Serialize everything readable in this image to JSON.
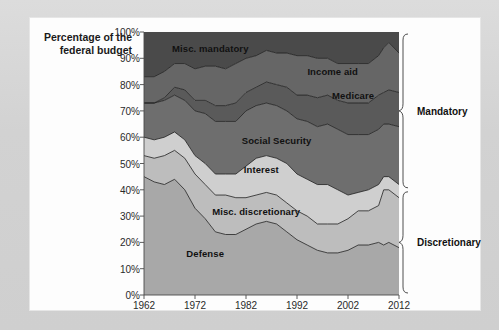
{
  "figure": {
    "background_color": "#d4d4d4",
    "card_color": "#fdfdfd"
  },
  "chart_data": {
    "type": "area",
    "title": "",
    "subtitle": "",
    "xlabel": "",
    "ylabel": "Percentage of the federal budget",
    "ylabel_line1": "Percentage of the",
    "ylabel_line2": "federal budget",
    "stacked": true,
    "normalized": true,
    "grid": false,
    "legend_position": "inline-labels",
    "xlim": [
      1962,
      2012
    ],
    "ylim": [
      0,
      100
    ],
    "xticks": [
      1962,
      1972,
      1982,
      1992,
      2002,
      2012
    ],
    "xtick_labels": [
      "1962",
      "1972",
      "1982",
      "1992",
      "2002",
      "2012"
    ],
    "yticks": [
      0,
      10,
      20,
      30,
      40,
      50,
      60,
      70,
      80,
      90,
      100
    ],
    "ytick_labels": [
      "0%",
      "10%",
      "20%",
      "30%",
      "40%",
      "50%",
      "60%",
      "70%",
      "80%",
      "90%",
      "100%"
    ],
    "x": [
      1962,
      1964,
      1966,
      1968,
      1970,
      1972,
      1974,
      1976,
      1978,
      1980,
      1982,
      1984,
      1986,
      1988,
      1990,
      1992,
      1994,
      1996,
      1998,
      2000,
      2002,
      2004,
      2006,
      2008,
      2009,
      2010,
      2012
    ],
    "series": [
      {
        "name": "Defense",
        "label": "Defense",
        "color": "#a8a8a8",
        "values": [
          45,
          43,
          42,
          44,
          40,
          33,
          29,
          24,
          23,
          23,
          25,
          27,
          28,
          27,
          24,
          21,
          19,
          17,
          16,
          16,
          17,
          19,
          19,
          20,
          19,
          20,
          18
        ]
      },
      {
        "name": "Misc. discretionary",
        "label": "Misc. discretionary",
        "color": "#bdbdbd",
        "values": [
          8,
          9,
          11,
          11,
          12,
          13,
          13,
          14,
          15,
          14,
          12,
          11,
          11,
          11,
          11,
          11,
          11,
          10,
          11,
          11,
          12,
          13,
          13,
          14,
          21,
          20,
          19
        ]
      },
      {
        "name": "Interest",
        "label": "Interest",
        "color": "#cfcfcf",
        "values": [
          7,
          7,
          7,
          7,
          7,
          7,
          8,
          8,
          8,
          9,
          12,
          14,
          14,
          14,
          15,
          14,
          14,
          15,
          15,
          13,
          9,
          7,
          8,
          8,
          5,
          5,
          5
        ]
      },
      {
        "name": "Social Security",
        "label": "Social Security",
        "color": "#6e6e6e",
        "values": [
          13,
          14,
          14,
          14,
          15,
          17,
          19,
          20,
          20,
          20,
          21,
          20,
          20,
          20,
          20,
          21,
          22,
          22,
          23,
          23,
          23,
          22,
          21,
          21,
          20,
          20,
          22
        ]
      },
      {
        "name": "Medicare",
        "label": "Medicare",
        "color": "#5a5a5a",
        "values": [
          0,
          0,
          1,
          3,
          4,
          4,
          5,
          6,
          6,
          7,
          7,
          7,
          8,
          8,
          9,
          9,
          10,
          11,
          11,
          11,
          12,
          12,
          12,
          13,
          12,
          13,
          13
        ]
      },
      {
        "name": "Income aid",
        "label": "Income aid",
        "color": "#666666",
        "values": [
          10,
          10,
          10,
          9,
          10,
          12,
          13,
          15,
          14,
          15,
          13,
          12,
          12,
          12,
          13,
          15,
          15,
          15,
          14,
          14,
          15,
          15,
          15,
          15,
          17,
          18,
          15
        ]
      },
      {
        "name": "Misc. mandatory",
        "label": "Misc. mandatory",
        "color": "#4a4a4a",
        "values": [
          17,
          17,
          15,
          12,
          12,
          14,
          13,
          13,
          14,
          12,
          10,
          9,
          7,
          8,
          8,
          9,
          9,
          10,
          10,
          12,
          12,
          12,
          12,
          9,
          6,
          4,
          8
        ]
      }
    ],
    "annotations": [
      {
        "text": "Misc. mandatory",
        "x": 1975,
        "y": 94
      },
      {
        "text": "Income aid",
        "x": 1999,
        "y": 85
      },
      {
        "text": "Medicare",
        "x": 2003,
        "y": 76
      },
      {
        "text": "Social Security",
        "x": 1988,
        "y": 59
      },
      {
        "text": "Interest",
        "x": 1985,
        "y": 48
      },
      {
        "text": "Misc. discretionary",
        "x": 1984,
        "y": 32
      },
      {
        "text": "Defense",
        "x": 1974,
        "y": 16
      }
    ],
    "brackets": [
      {
        "label": "Mandatory",
        "from": 40,
        "to": 100
      },
      {
        "label": "Discretionary",
        "from": 0,
        "to": 40
      }
    ]
  }
}
